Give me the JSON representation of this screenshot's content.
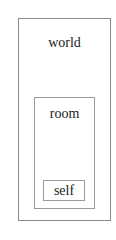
{
  "diagram": {
    "type": "nested-boxes",
    "nodes": [
      {
        "id": "world",
        "label": "world",
        "parent": null
      },
      {
        "id": "room",
        "label": "room",
        "parent": "world"
      },
      {
        "id": "self",
        "label": "self",
        "parent": "room"
      }
    ],
    "colors": {
      "border": "#8a8a8a",
      "background": "#ffffff",
      "text": "#222222"
    }
  }
}
